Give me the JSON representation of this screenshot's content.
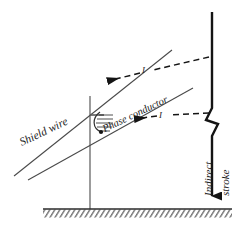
{
  "figure": {
    "background": "#ffffff",
    "line_color": "#3a3a3a",
    "bold_line_color": "#141414",
    "text_color": "#1a1a1a",
    "width": 249,
    "height": 230
  },
  "labels": {
    "shield_wire": "Shield wire",
    "phase_conductor": "Phase conductor",
    "indirect": "Indirect",
    "stroke": "stroke",
    "current_upper": "I",
    "current_lower": "I"
  },
  "elements": {
    "shield_wire_name": "shield-wire-line",
    "phase_conductor_name": "phase-conductor-line",
    "tower_name": "tower-mast",
    "insulator_name": "insulator-string",
    "ground_name": "ground-line",
    "stroke_name": "lightning-stroke",
    "coupled_current_upper_name": "induced-current-arrow-shield",
    "coupled_current_lower_name": "induced-current-arrow-phase"
  },
  "geometry": {
    "shield_wire": {
      "x1": 14,
      "y1": 176,
      "x2": 172,
      "y2": 50
    },
    "phase_conductor": {
      "x1": 28,
      "y1": 180,
      "x2": 193,
      "y2": 88
    },
    "tower": {
      "x": 90,
      "y_top": 96,
      "y_bottom": 209
    },
    "ground": {
      "x1": 43,
      "x2": 232,
      "y": 209
    },
    "stroke_line": {
      "x": 212,
      "y_top": 12,
      "y_bottom": 207
    }
  }
}
